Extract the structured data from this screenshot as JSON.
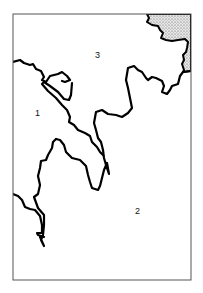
{
  "map": {
    "width": 203,
    "height": 293,
    "frame": {
      "x": 13,
      "y": 14,
      "width": 178,
      "height": 266,
      "stroke": "#555555"
    },
    "colors": {
      "line": "#000000",
      "background": "#ffffff",
      "stipple": "#bdbdbd"
    },
    "regions": [
      {
        "id": "1",
        "label": "1",
        "x": 37,
        "y": 113
      },
      {
        "id": "2",
        "label": "2",
        "x": 138,
        "y": 213
      },
      {
        "id": "3",
        "label": "3",
        "x": 97,
        "y": 57
      }
    ],
    "stippled_area": "upper-right corner"
  }
}
